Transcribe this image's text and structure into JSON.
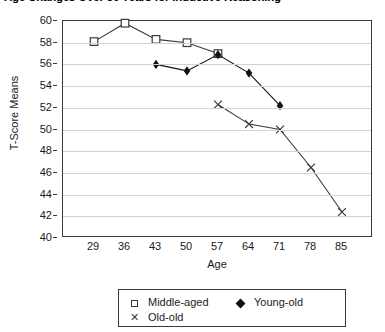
{
  "chart_data": {
    "type": "line",
    "title": "Age Changes Over 56 Years for Inductive Reasoning",
    "xlabel": "Age",
    "ylabel": "T-Score Means",
    "x": [
      29,
      36,
      43,
      50,
      57,
      64,
      71,
      78,
      85
    ],
    "xtick_labels": [
      "29",
      "36",
      "43",
      "50",
      "57",
      "64",
      "71",
      "78",
      "85"
    ],
    "ytick_labels": [
      "40",
      "42",
      "44",
      "46",
      "48",
      "50",
      "52",
      "54",
      "56",
      "58",
      "60"
    ],
    "yticks": [
      40,
      42,
      44,
      46,
      48,
      50,
      52,
      54,
      56,
      58,
      60
    ],
    "ylim": [
      40,
      60
    ],
    "xlim": [
      29,
      85
    ],
    "grid": "horizontal",
    "legend_position": "below-plot",
    "series": [
      {
        "name": "Middle-aged",
        "marker": "open-square",
        "color": "#3a3a3a",
        "x": [
          29,
          36,
          43,
          50,
          57
        ],
        "values": [
          58.1,
          59.8,
          58.3,
          58.0,
          57.0
        ]
      },
      {
        "name": "Young-old",
        "marker": "filled-diamond",
        "color": "#111111",
        "x": [
          43,
          50,
          57,
          64,
          71
        ],
        "values": [
          56.0,
          55.4,
          56.9,
          55.2,
          52.2
        ]
      },
      {
        "name": "Old-old",
        "marker": "x",
        "color": "#3a3a3a",
        "x": [
          57,
          64,
          71,
          78,
          85
        ],
        "values": [
          52.3,
          50.5,
          50.0,
          46.5,
          42.4
        ]
      }
    ]
  },
  "legend": {
    "entries": [
      {
        "label": "Middle-aged",
        "marker": "open-square-icon"
      },
      {
        "label": "Young-old",
        "marker": "filled-diamond-icon"
      },
      {
        "label": "Old-old",
        "marker": "x-marker-icon"
      }
    ]
  }
}
